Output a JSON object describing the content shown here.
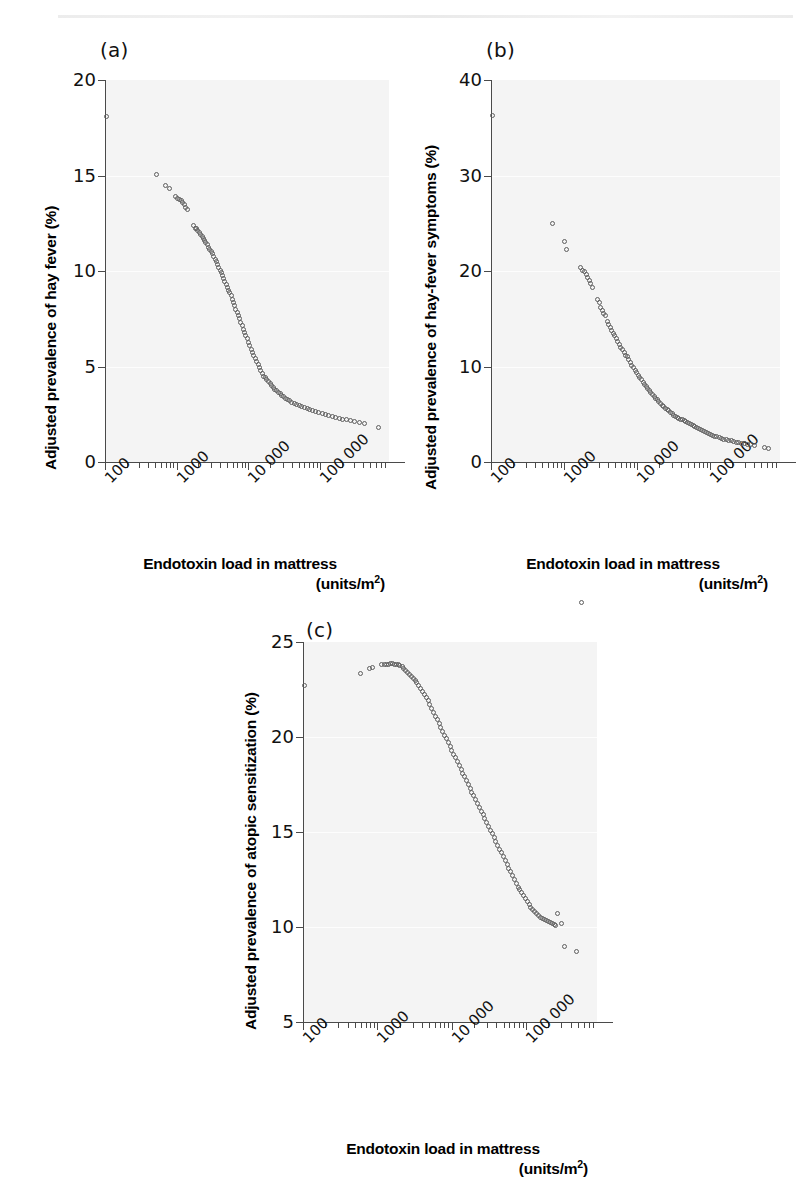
{
  "figure": {
    "panels": [
      {
        "tag": "(a)",
        "ylabel": "Adjusted prevalence of hay fever (%)",
        "xlabel_line1": "Endotoxin load in mattress",
        "xlabel_line2": "(units/m",
        "xlabel_exp": "2",
        "xlabel_close": ")",
        "yticks": [
          "0",
          "5",
          "10",
          "15",
          "20"
        ],
        "xticks": [
          "100",
          "1000",
          "10 000",
          "100 000"
        ]
      },
      {
        "tag": "(b)",
        "ylabel": "Adjusted prevalence of hay-fever symptoms (%)",
        "xlabel_line1": "Endotoxin load in mattress",
        "xlabel_line2": "(units/m",
        "xlabel_exp": "2",
        "xlabel_close": ")",
        "yticks": [
          "0",
          "10",
          "20",
          "30",
          "40"
        ],
        "xticks": [
          "100",
          "1000",
          "10 000",
          "100 000"
        ]
      },
      {
        "tag": "(c)",
        "ylabel": "Adjusted prevalence of atopic sensitization (%)",
        "xlabel_line1": "Endotoxin load in mattress",
        "xlabel_line2": "(units/m",
        "xlabel_exp": "2",
        "xlabel_close": ")",
        "yticks": [
          "5",
          "10",
          "15",
          "20",
          "25"
        ],
        "xticks": [
          "100",
          "1000",
          "10 000",
          "100 000"
        ]
      }
    ]
  },
  "chart_data": [
    {
      "type": "scatter",
      "panel": "(a)",
      "title": "",
      "xlabel": "Endotoxin load in mattress (units/m2)",
      "ylabel": "Adjusted prevalence of hay fever (%)",
      "xscale": "log",
      "xlim": [
        100,
        800000
      ],
      "ylim": [
        0,
        20
      ],
      "yticks": [
        0,
        5,
        10,
        15,
        20
      ],
      "xticks": [
        100,
        1000,
        10000,
        100000
      ],
      "grid": true,
      "legend": "none",
      "marker": "open-circle",
      "x": [
        105,
        520,
        700,
        790,
        950,
        1020,
        1090,
        1150,
        1210,
        1280,
        1340,
        1410,
        1700,
        1800,
        1880,
        1960,
        2050,
        2150,
        2250,
        2350,
        2450,
        2550,
        2650,
        2780,
        2900,
        3020,
        3150,
        3280,
        3420,
        3560,
        3700,
        3860,
        4020,
        4180,
        4350,
        4530,
        4700,
        4900,
        5100,
        5300,
        5500,
        5720,
        5950,
        6200,
        6450,
        6700,
        6980,
        7250,
        7550,
        7850,
        8150,
        8500,
        8850,
        9200,
        9600,
        10000,
        10400,
        10900,
        11400,
        11900,
        12400,
        13000,
        13600,
        14200,
        14900,
        15600,
        16400,
        17200,
        18100,
        19000,
        20000,
        21000,
        22200,
        23400,
        24700,
        26100,
        27600,
        29200,
        31000,
        33000,
        35200,
        37600,
        40400,
        43500,
        47000,
        51000,
        55500,
        60500,
        66000,
        72000,
        79000,
        87000,
        96000,
        106000,
        118000,
        131000,
        146000,
        163000,
        183000,
        205000,
        232000,
        265000,
        305000,
        355000,
        420000,
        640000
      ],
      "y": [
        18.1,
        15.05,
        14.5,
        14.3,
        13.9,
        13.8,
        13.75,
        13.7,
        13.6,
        13.5,
        13.35,
        13.2,
        12.4,
        12.25,
        12.2,
        12.1,
        12.0,
        11.9,
        11.8,
        11.7,
        11.6,
        11.5,
        11.4,
        11.25,
        11.1,
        11.0,
        10.9,
        10.75,
        10.6,
        10.5,
        10.35,
        10.2,
        10.05,
        9.9,
        9.75,
        9.6,
        9.45,
        9.3,
        9.15,
        9.0,
        8.85,
        8.7,
        8.5,
        8.35,
        8.2,
        8.0,
        7.85,
        7.65,
        7.5,
        7.3,
        7.15,
        6.95,
        6.8,
        6.6,
        6.45,
        6.25,
        6.1,
        5.9,
        5.75,
        5.6,
        5.4,
        5.25,
        5.1,
        4.95,
        4.8,
        4.65,
        4.5,
        4.4,
        4.3,
        4.2,
        4.1,
        4.0,
        3.9,
        3.8,
        3.72,
        3.65,
        3.58,
        3.5,
        3.42,
        3.35,
        3.28,
        3.2,
        3.12,
        3.05,
        3.0,
        2.95,
        2.9,
        2.85,
        2.8,
        2.75,
        2.7,
        2.65,
        2.6,
        2.55,
        2.5,
        2.45,
        2.4,
        2.35,
        2.3,
        2.25,
        2.2,
        2.15,
        2.1,
        2.05,
        2.0,
        1.8
      ]
    },
    {
      "type": "scatter",
      "panel": "(b)",
      "title": "",
      "xlabel": "Endotoxin load in mattress (units/m2)",
      "ylabel": "Adjusted prevalence of hay-fever symptoms (%)",
      "xscale": "log",
      "xlim": [
        100,
        800000
      ],
      "ylim": [
        0,
        40
      ],
      "yticks": [
        0,
        10,
        20,
        30,
        40
      ],
      "xticks": [
        100,
        1000,
        10000,
        100000
      ],
      "grid": true,
      "legend": "none",
      "marker": "open-circle",
      "x": [
        105,
        700,
        1000,
        1080,
        1700,
        1800,
        1900,
        2000,
        2100,
        2200,
        2320,
        2450,
        2900,
        3050,
        3200,
        3350,
        3520,
        3700,
        3880,
        4080,
        4280,
        4500,
        4720,
        4960,
        5200,
        5460,
        5740,
        6030,
        6330,
        6650,
        6980,
        7340,
        7710,
        8100,
        8520,
        8950,
        9400,
        9880,
        10400,
        10900,
        11500,
        12100,
        12700,
        13300,
        14000,
        14700,
        15500,
        16300,
        17100,
        18000,
        18900,
        19900,
        21000,
        22100,
        23200,
        24500,
        25800,
        27200,
        28600,
        30200,
        31800,
        33600,
        35400,
        37400,
        39500,
        41700,
        44100,
        46600,
        49300,
        52200,
        55300,
        58600,
        62100,
        65900,
        69900,
        74200,
        78900,
        83900,
        89300,
        95200,
        101000,
        108000,
        116000,
        124000,
        133000,
        143000,
        154000,
        166000,
        179000,
        194000,
        210000,
        228000,
        248000,
        271000,
        297000,
        326000,
        360000,
        400000,
        560000,
        640000
      ],
      "y": [
        36.3,
        25.0,
        23.1,
        22.2,
        20.4,
        20.1,
        19.9,
        19.6,
        19.3,
        19.0,
        18.7,
        18.3,
        17.0,
        16.7,
        16.2,
        15.9,
        15.6,
        15.3,
        14.7,
        14.4,
        14.1,
        13.8,
        13.5,
        13.2,
        12.9,
        12.6,
        12.3,
        12.0,
        11.8,
        11.5,
        11.2,
        11.0,
        10.7,
        10.4,
        10.1,
        9.85,
        9.6,
        9.35,
        9.1,
        8.85,
        8.6,
        8.35,
        8.1,
        7.9,
        7.7,
        7.5,
        7.3,
        7.1,
        6.9,
        6.7,
        6.5,
        6.3,
        6.1,
        5.95,
        5.8,
        5.65,
        5.5,
        5.35,
        5.2,
        5.05,
        4.9,
        4.8,
        4.7,
        4.6,
        4.5,
        4.4,
        4.3,
        4.2,
        4.1,
        4.0,
        3.9,
        3.8,
        3.7,
        3.6,
        3.5,
        3.4,
        3.3,
        3.2,
        3.1,
        3.0,
        2.9,
        2.8,
        2.7,
        2.65,
        2.6,
        2.5,
        2.4,
        2.35,
        2.3,
        2.2,
        2.1,
        2.05,
        2.0,
        1.95,
        1.9,
        1.85,
        1.8,
        1.75,
        1.5,
        1.45
      ]
    },
    {
      "type": "scatter",
      "panel": "(c)",
      "title": "",
      "xlabel": "Endotoxin load in mattress (units/m2)",
      "ylabel": "Adjusted prevalence of atopic sensitization (%)",
      "xscale": "log",
      "xlim": [
        100,
        800000
      ],
      "ylim": [
        5,
        25
      ],
      "yticks": [
        5,
        10,
        15,
        20,
        25
      ],
      "xticks": [
        100,
        1000,
        10000,
        100000
      ],
      "grid": true,
      "legend": "none",
      "marker": "open-circle",
      "x": [
        105,
        600,
        780,
        860,
        1150,
        1250,
        1330,
        1420,
        1500,
        1600,
        1700,
        1800,
        1900,
        2020,
        2150,
        2280,
        2420,
        2560,
        2720,
        2880,
        3050,
        3230,
        3420,
        3620,
        3840,
        4060,
        4300,
        4550,
        4820,
        5100,
        5400,
        5720,
        6050,
        6400,
        6780,
        7180,
        7600,
        8050,
        8520,
        9020,
        9550,
        10100,
        10700,
        11300,
        12000,
        12700,
        13400,
        14200,
        15000,
        15900,
        16800,
        17800,
        18800,
        19900,
        21100,
        22300,
        23600,
        25000,
        26500,
        28000,
        29700,
        31400,
        33300,
        35200,
        37300,
        39500,
        41800,
        44300,
        46900,
        49700,
        52600,
        55700,
        59000,
        62500,
        66200,
        70100,
        74200,
        78600,
        83200,
        88100,
        93300,
        98800,
        105000,
        111000,
        117000,
        124000,
        132000,
        140000,
        148000,
        157000,
        167000,
        177000,
        188000,
        200000,
        212000,
        225000,
        239000,
        254000,
        270000,
        300000,
        330000,
        480000,
        560000
      ],
      "y": [
        22.7,
        23.35,
        23.6,
        23.65,
        23.8,
        23.82,
        23.83,
        23.84,
        23.85,
        23.85,
        23.84,
        23.83,
        23.8,
        23.75,
        23.7,
        23.6,
        23.5,
        23.4,
        23.3,
        23.2,
        23.1,
        23.0,
        22.85,
        22.7,
        22.55,
        22.4,
        22.25,
        22.1,
        21.9,
        21.7,
        21.5,
        21.3,
        21.1,
        20.9,
        20.7,
        20.5,
        20.3,
        20.1,
        19.9,
        19.7,
        19.5,
        19.3,
        19.1,
        18.9,
        18.7,
        18.5,
        18.3,
        18.1,
        17.9,
        17.7,
        17.5,
        17.3,
        17.1,
        16.9,
        16.7,
        16.5,
        16.3,
        16.1,
        15.9,
        15.7,
        15.5,
        15.3,
        15.1,
        14.9,
        14.7,
        14.5,
        14.3,
        14.1,
        13.9,
        13.7,
        13.5,
        13.3,
        13.1,
        12.9,
        12.7,
        12.5,
        12.3,
        12.1,
        11.95,
        11.8,
        11.65,
        11.5,
        11.35,
        11.2,
        11.05,
        10.9,
        10.8,
        10.7,
        10.6,
        10.5,
        10.45,
        10.4,
        10.35,
        10.3,
        10.25,
        10.2,
        10.15,
        10.1,
        10.7,
        10.2,
        9.0,
        8.7
      ]
    }
  ]
}
